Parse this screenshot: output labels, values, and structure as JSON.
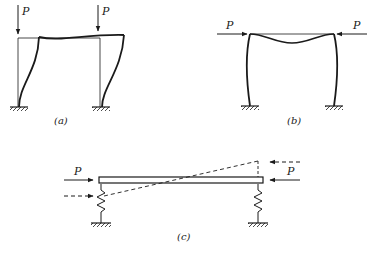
{
  "figure": {
    "panels": [
      {
        "id": "a",
        "caption": "(a)",
        "description": "Portal frame, sway buckling mode under vertical loads",
        "loads": [
          {
            "label": "P",
            "direction": "down"
          },
          {
            "label": "P",
            "direction": "down"
          }
        ]
      },
      {
        "id": "b",
        "caption": "(b)",
        "description": "Portal frame, symmetric buckling mode under horizontal loads on beam",
        "loads": [
          {
            "label": "P",
            "direction": "right"
          },
          {
            "label": "P",
            "direction": "left"
          }
        ]
      },
      {
        "id": "c",
        "caption": "(c)",
        "description": "Rigid bar on spring supports under axial compression, dashed displaced position",
        "loads": [
          {
            "label": "P",
            "direction": "right"
          },
          {
            "label": "P",
            "direction": "left"
          }
        ]
      }
    ],
    "colors": {
      "line": "#1a1a1a",
      "background": "#ffffff"
    }
  }
}
